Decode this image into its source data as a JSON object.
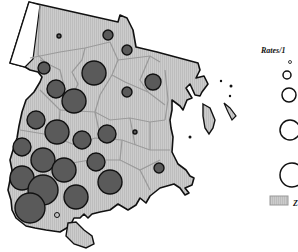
{
  "map": {
    "type": "proportional-symbol-map",
    "region_fill": "#c8c8c8",
    "region_stroke": "#111111",
    "boundary_color": "#9a9a9a",
    "symbol_fill": "#5a5a5a",
    "symbol_stroke": "#111111",
    "symbols": [
      {
        "x": 59,
        "y": 36,
        "r": 2
      },
      {
        "x": 108,
        "y": 35,
        "r": 5
      },
      {
        "x": 127,
        "y": 50,
        "r": 5
      },
      {
        "x": 44,
        "y": 68,
        "r": 6
      },
      {
        "x": 94,
        "y": 73,
        "r": 12
      },
      {
        "x": 153,
        "y": 82,
        "r": 8
      },
      {
        "x": 127,
        "y": 92,
        "r": 5
      },
      {
        "x": 56,
        "y": 89,
        "r": 9
      },
      {
        "x": 74,
        "y": 101,
        "r": 12
      },
      {
        "x": 36,
        "y": 120,
        "r": 9
      },
      {
        "x": 57,
        "y": 132,
        "r": 12
      },
      {
        "x": 82,
        "y": 140,
        "r": 9
      },
      {
        "x": 107,
        "y": 134,
        "r": 9
      },
      {
        "x": 135,
        "y": 132,
        "r": 2
      },
      {
        "x": 22,
        "y": 147,
        "r": 9
      },
      {
        "x": 43,
        "y": 160,
        "r": 12
      },
      {
        "x": 64,
        "y": 170,
        "r": 12
      },
      {
        "x": 96,
        "y": 162,
        "r": 9
      },
      {
        "x": 159,
        "y": 168,
        "r": 5
      },
      {
        "x": 22,
        "y": 178,
        "r": 12
      },
      {
        "x": 43,
        "y": 190,
        "r": 15
      },
      {
        "x": 110,
        "y": 182,
        "r": 12
      },
      {
        "x": 76,
        "y": 197,
        "r": 12
      },
      {
        "x": 30,
        "y": 208,
        "r": 15
      }
    ]
  },
  "legend": {
    "title": "Rates/1",
    "circles": [
      {
        "label_r": 1.5,
        "cx": 290,
        "cy": 62
      },
      {
        "label_r": 4,
        "cx": 287,
        "cy": 75
      },
      {
        "label_r": 7,
        "cx": 289,
        "cy": 95
      },
      {
        "label_r": 10,
        "cx": 290,
        "cy": 130
      },
      {
        "label_r": 12,
        "cx": 292,
        "cy": 175
      }
    ],
    "zip_swatch_label": "Z",
    "zip_swatch_fill": "#c8c8c8"
  }
}
